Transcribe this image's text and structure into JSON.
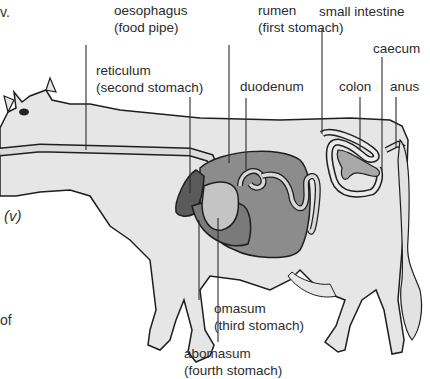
{
  "diagram": {
    "labels": {
      "oesophagus": {
        "name": "oesophagus",
        "note": "(food pipe)"
      },
      "rumen": {
        "name": "rumen",
        "note": "(first stomach)"
      },
      "small_intestine": {
        "name": "small intestine"
      },
      "caecum": {
        "name": "caecum"
      },
      "reticulum": {
        "name": "reticulum",
        "note": "(second stomach)"
      },
      "duodenum": {
        "name": "duodenum"
      },
      "colon": {
        "name": "colon"
      },
      "anus": {
        "name": "anus"
      },
      "omasum": {
        "name": "omasum",
        "note": "(third stomach)"
      },
      "abomasum": {
        "name": "abomasum",
        "note": "(fourth stomach)"
      }
    },
    "side_text": {
      "top_fragment": "v.",
      "roman_numeral": "(v)",
      "bottom_fragment": "of"
    },
    "colors": {
      "body": "#e6e6e6",
      "outline": "#1e1e1e",
      "rumen": "#8c8c8c",
      "reticulum": "#5a5a5a",
      "omasum": "#c4c4c4",
      "abomasum": "#7a7a7a",
      "intestine": "#a8a8a8",
      "leader_line": "#2a2a2a"
    }
  }
}
